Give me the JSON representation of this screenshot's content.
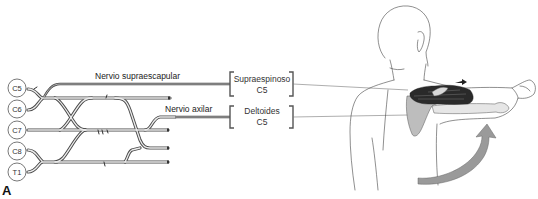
{
  "figure": {
    "panel_label": "A",
    "roots": [
      {
        "id": "c5",
        "label": "C5"
      },
      {
        "id": "c6",
        "label": "C6"
      },
      {
        "id": "c7",
        "label": "C7"
      },
      {
        "id": "c8",
        "label": "C8"
      },
      {
        "id": "t1",
        "label": "T1"
      }
    ],
    "nerves": [
      {
        "id": "suprascapular",
        "label": "Nervio supraescapular"
      },
      {
        "id": "axillary",
        "label": "Nervio axilar"
      }
    ],
    "muscles": [
      {
        "id": "supraspinatus",
        "name": "Supraespinoso",
        "root": "C5"
      },
      {
        "id": "deltoid",
        "name": "Deltoides",
        "root": "C5"
      }
    ],
    "illustration": "shoulder-abduction-posterior-view",
    "colors": {
      "nerve_stroke": "#555555",
      "nerve_fill": "#e4e4e4",
      "leader_line": "#777777",
      "muscle_dark": "#2a2a2a",
      "scapula_fill": "#bdbdbd",
      "arrow_fill": "#9a9a9a",
      "outline": "#444444"
    }
  }
}
